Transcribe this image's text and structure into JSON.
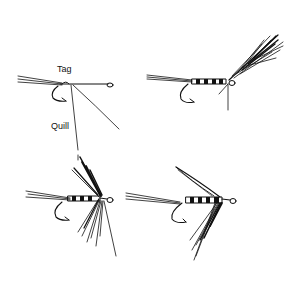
{
  "figure": {
    "panels": [
      {
        "id": "step-1",
        "description": "hook with tag and quill tied in"
      },
      {
        "id": "step-2",
        "description": "body wrapped, hackle feather tied in"
      },
      {
        "id": "step-3",
        "description": "hackle wound, fibers swept"
      },
      {
        "id": "step-4",
        "description": "completed wet fly with wing"
      }
    ],
    "labels": {
      "tag": "Tag",
      "quill": "Quill"
    },
    "colors": {
      "ink": "#111111",
      "paper": "#ffffff"
    }
  }
}
